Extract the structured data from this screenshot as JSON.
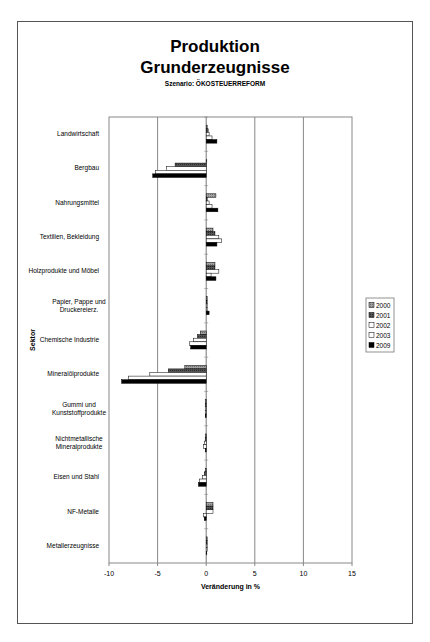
{
  "chart_data": {
    "type": "bar",
    "orientation": "horizontal",
    "title": "Produktion",
    "title_line2": "Grunderzeugnisse",
    "subtitle": "Szenario: ÖKOSTEUERREFORM",
    "xlabel": "Veränderung in %",
    "ylabel": "Sektor",
    "xlim": [
      -10,
      15
    ],
    "xticks": [
      "-10",
      "-5",
      "0",
      "5",
      "10",
      "15"
    ],
    "xtick_values": [
      -10,
      -5,
      0,
      5,
      10,
      15
    ],
    "grid": "vertical",
    "legend_position": "right",
    "categories": [
      [
        "Landwirtschaft"
      ],
      [
        "Bergbau"
      ],
      [
        "Nahrungsmittel"
      ],
      [
        "Textilien, Bekleidung"
      ],
      [
        "Holzprodukte und Möbel"
      ],
      [
        "Papier, Pappe und",
        "Druckereierz."
      ],
      [
        "Chemische Industrie"
      ],
      [
        "Mineralölprodukte"
      ],
      [
        "Gummi und",
        "Kunststoffprodukte"
      ],
      [
        "Nichtmetallische",
        "Mineralprodukte"
      ],
      [
        "Eisen und Stahl"
      ],
      [
        "NF-Metalle"
      ],
      [
        "Metallerzeugnisse"
      ]
    ],
    "series": [
      {
        "name": "2000",
        "color": "#8c8c8c",
        "pattern": "light",
        "values": [
          0.1,
          0.0,
          1.0,
          0.7,
          0.9,
          0.1,
          -0.6,
          -2.2,
          -0.1,
          -0.1,
          -0.1,
          0.7,
          0.1
        ]
      },
      {
        "name": "2001",
        "color": "#4a4a4a",
        "pattern": "dark",
        "values": [
          0.2,
          -3.2,
          0.1,
          0.9,
          0.9,
          0.1,
          -0.9,
          -3.9,
          -0.1,
          -0.1,
          -0.2,
          0.7,
          0.1
        ]
      },
      {
        "name": "2002",
        "color": "#ffffff",
        "pattern": "white",
        "values": [
          0.3,
          -4.1,
          0.3,
          1.3,
          1.3,
          0.1,
          -1.3,
          -5.8,
          -0.1,
          -0.2,
          -0.4,
          0.7,
          0.1
        ]
      },
      {
        "name": "2003",
        "color": "#ffffff",
        "pattern": "white",
        "values": [
          0.6,
          -5.2,
          0.6,
          1.6,
          0.5,
          0.1,
          -1.7,
          -8.0,
          -0.1,
          -0.3,
          -0.7,
          -0.3,
          0.1
        ]
      },
      {
        "name": "2009",
        "color": "#000000",
        "pattern": "black",
        "values": [
          1.1,
          -5.5,
          1.2,
          1.1,
          1.0,
          0.3,
          -1.6,
          -8.7,
          -0.1,
          -0.1,
          -0.8,
          -0.2,
          0.0
        ]
      }
    ]
  }
}
